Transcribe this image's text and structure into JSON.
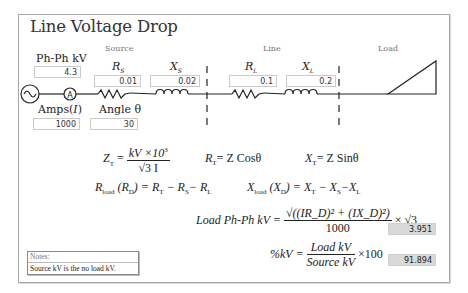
{
  "title": "Line Voltage Drop",
  "sections": {
    "source": "Source",
    "line": "Line",
    "load": "Load"
  },
  "inputs": {
    "ph_ph_kv": {
      "label": "Ph-Ph kV",
      "value": "4.3"
    },
    "rs": {
      "label": "R",
      "sub": "S",
      "value": "0.01"
    },
    "xs": {
      "label": "X",
      "sub": "S",
      "value": "0.02"
    },
    "rl": {
      "label": "R",
      "sub": "L",
      "value": "0.1"
    },
    "xl": {
      "label": "X",
      "sub": "L",
      "value": "0.2"
    },
    "amps": {
      "label": "Amps(",
      "var": "I",
      "close": ")",
      "value": "1000"
    },
    "angle": {
      "label": "Angle θ",
      "value": "30"
    }
  },
  "circuit": {
    "ammeter_symbol": "A"
  },
  "formulas": {
    "zt_lhs": "Z",
    "zt_sub": "T",
    "zt_num": "kV ×10",
    "zt_num_sup": "3",
    "zt_den": "√3 I",
    "rt": "R",
    "rt_sub": "T",
    "rt_rhs": "= Z Cosθ",
    "xt": "X",
    "xt_sub": "T",
    "xt_rhs": "= Z Sinθ",
    "rload": "R",
    "rload_sub": "load",
    "rload_mid": "(R",
    "rload_mid_sub": "D",
    "rload_rhs": ") = R",
    "rload_rhs_tail": "− R",
    "rload_tail_sub1": "T",
    "rload_tail_sub2": "S",
    "rload_tail_end": "− R",
    "rload_tail_sub3": "L",
    "xload": "X",
    "xload_sub": "load",
    "xload_mid": "(X",
    "xload_mid_sub": "D",
    "xload_rhs": ") = X",
    "xload_sub1": "T",
    "xload_tail": "− X",
    "xload_sub2": "S",
    "xload_tail2": "−X",
    "xload_sub3": "L",
    "loadkv_lhs": "Load Ph-Ph kV =",
    "loadkv_num": "√((IR_D)² + (IX_D)²)",
    "loadkv_den": "1000",
    "loadkv_tail": "× √3",
    "pct_lhs": "%kV =",
    "pct_num": "Load kV",
    "pct_den": "Source kV",
    "pct_tail": "×100"
  },
  "outputs": {
    "load_ph_ph_kv": "3.951",
    "pct_kv": "91.894"
  },
  "notes": {
    "header": "Notes:",
    "body": "Source kV is the no load kV."
  }
}
